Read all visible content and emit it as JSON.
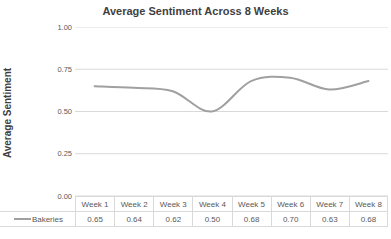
{
  "colors": {
    "line": "#a0a0a0",
    "grid": "#d9d9d9",
    "border": "#d9d9d9",
    "text": "#595959",
    "title": "#3f3f3f",
    "background": "#ffffff"
  },
  "chart_data": {
    "type": "line",
    "title": "Average Sentiment Across 8 Weeks",
    "xlabel": "",
    "ylabel": "Average Sentiment",
    "categories": [
      "Week 1",
      "Week 2",
      "Week 3",
      "Week 4",
      "Week 5",
      "Week 6",
      "Week 7",
      "Week 8"
    ],
    "series": [
      {
        "name": "Bakeries",
        "values": [
          0.65,
          0.64,
          0.62,
          0.5,
          0.68,
          0.7,
          0.63,
          0.68
        ],
        "value_labels": [
          "0.65",
          "0.64",
          "0.62",
          "0.50",
          "0.68",
          "0.70",
          "0.63",
          "0.68"
        ]
      }
    ],
    "ylim": [
      0,
      1
    ],
    "yticks": [
      "1.00",
      "0.75",
      "0.50",
      "0.25",
      "0.00"
    ],
    "grid": true,
    "smooth": true,
    "legend_position": "data-table-left"
  }
}
